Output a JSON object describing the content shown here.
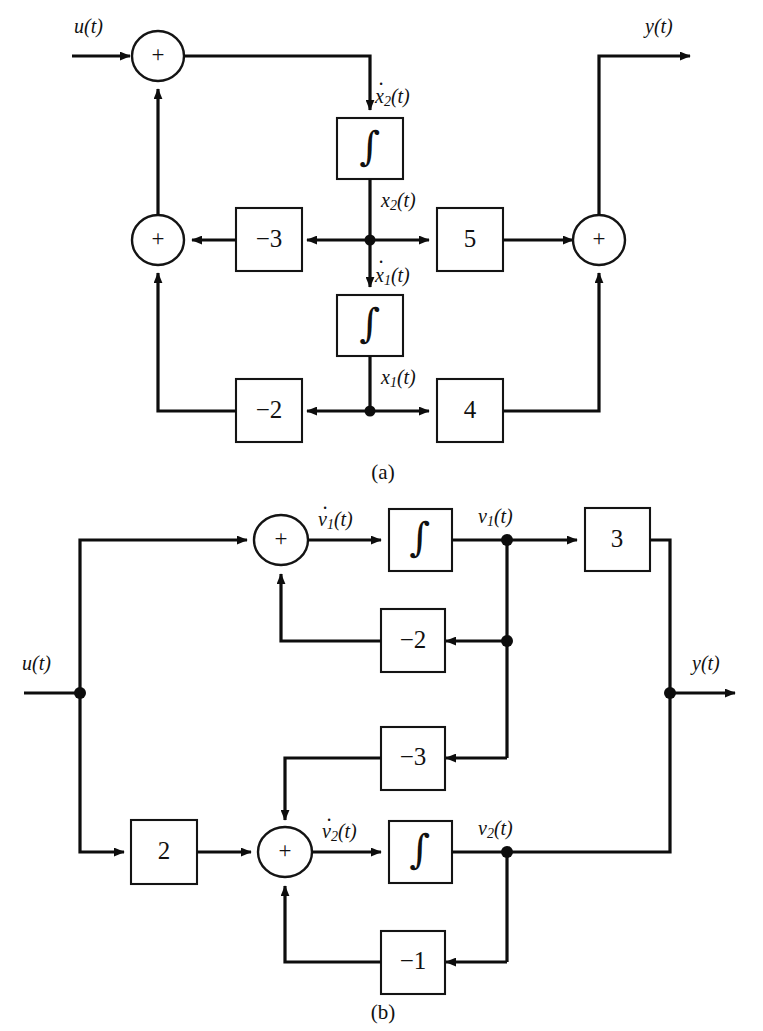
{
  "figure": {
    "panels": [
      {
        "id": "a",
        "caption": "(a)",
        "input_label": "u(t)",
        "output_label": "y(t)",
        "summers": [
          {
            "name": "top-summer",
            "sign": "+"
          },
          {
            "name": "middle-summer",
            "sign": "+"
          },
          {
            "name": "output-summer",
            "sign": "+"
          }
        ],
        "integrators": [
          {
            "name": "integrator-x2",
            "symbol": "∫",
            "input_signal": "ẋ₂(t)",
            "output_signal": "x₂(t)"
          },
          {
            "name": "integrator-x1",
            "symbol": "∫",
            "input_signal": "ẋ₁(t)",
            "output_signal": "x₁(t)"
          }
        ],
        "gains": [
          {
            "name": "gain-minus3",
            "value": "−3"
          },
          {
            "name": "gain-5",
            "value": "5"
          },
          {
            "name": "gain-minus2",
            "value": "−2"
          },
          {
            "name": "gain-4",
            "value": "4"
          }
        ],
        "signals": {
          "x2dot": {
            "base": "x",
            "sub": "2",
            "arg": "(t)",
            "dot": true
          },
          "x2": {
            "base": "x",
            "sub": "2",
            "arg": "(t)",
            "dot": false
          },
          "x1dot": {
            "base": "x",
            "sub": "1",
            "arg": "(t)",
            "dot": true
          },
          "x1": {
            "base": "x",
            "sub": "1",
            "arg": "(t)",
            "dot": false
          }
        }
      },
      {
        "id": "b",
        "caption": "(b)",
        "input_label": "u(t)",
        "output_label": "y(t)",
        "summers": [
          {
            "name": "summer-v1",
            "sign": "+"
          },
          {
            "name": "summer-v2",
            "sign": "+"
          }
        ],
        "integrators": [
          {
            "name": "integrator-v1",
            "symbol": "∫",
            "input_signal": "v̇₁(t)",
            "output_signal": "v₁(t)"
          },
          {
            "name": "integrator-v2",
            "symbol": "∫",
            "input_signal": "v̇₂(t)",
            "output_signal": "v₂(t)"
          }
        ],
        "gains": [
          {
            "name": "gain-3",
            "value": "3"
          },
          {
            "name": "gain-minus2",
            "value": "−2"
          },
          {
            "name": "gain-minus3",
            "value": "−3"
          },
          {
            "name": "gain-2",
            "value": "2"
          },
          {
            "name": "gain-minus1",
            "value": "−1"
          }
        ],
        "signals": {
          "v1dot": {
            "base": "v",
            "sub": "1",
            "arg": "(t)",
            "dot": true
          },
          "v1": {
            "base": "v",
            "sub": "1",
            "arg": "(t)",
            "dot": false
          },
          "v2dot": {
            "base": "v",
            "sub": "2",
            "arg": "(t)",
            "dot": true
          },
          "v2": {
            "base": "v",
            "sub": "2",
            "arg": "(t)",
            "dot": false
          }
        }
      }
    ],
    "colors": {
      "line": "#0d0d0d",
      "text": "#111111",
      "background": "#ffffff"
    }
  }
}
